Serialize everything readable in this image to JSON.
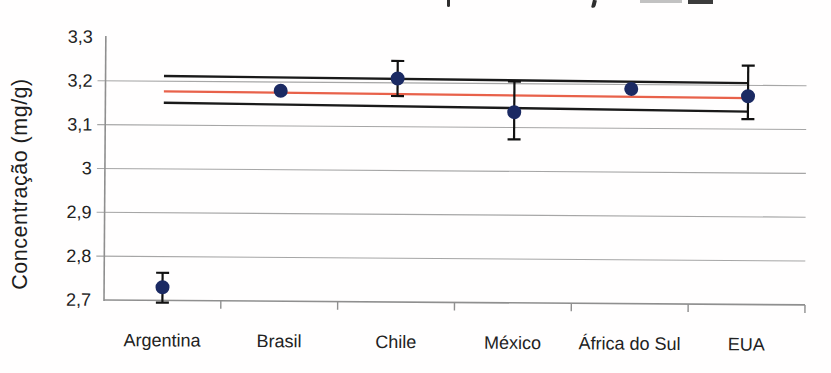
{
  "figure": {
    "background": "#fffefe",
    "cropped_top_fragments": [
      {
        "x": 447,
        "y": 0,
        "w": 3,
        "h": 7,
        "color": "#2e2e2e",
        "radius": "0 0 2px 2px",
        "rotate": 0
      },
      {
        "x": 592,
        "y": 0,
        "w": 4,
        "h": 8,
        "color": "#2e2e2e",
        "radius": "0 0 3px 1px",
        "rotate": 14
      },
      {
        "x": 640,
        "y": 0,
        "w": 42,
        "h": 3,
        "color": "#c2c2c2",
        "radius": "0",
        "rotate": 0
      },
      {
        "x": 688,
        "y": 0,
        "w": 25,
        "h": 4,
        "color": "#3c3c3c",
        "radius": "0",
        "rotate": 0
      }
    ]
  },
  "chart_data": {
    "type": "scatter",
    "title": "",
    "xlabel": "",
    "ylabel": "Concentração (mg/g)",
    "categories": [
      "Argentina",
      "Brasil",
      "Chile",
      "México",
      "África do Sul",
      "EUA"
    ],
    "points": [
      {
        "label": "Argentina",
        "value": 2.73,
        "err_up": 0.033,
        "err_down": 0.035
      },
      {
        "label": "Brasil",
        "value": 3.18,
        "err_up": 0,
        "err_down": 0
      },
      {
        "label": "Chile",
        "value": 3.21,
        "err_up": 0.04,
        "err_down": 0.04
      },
      {
        "label": "México",
        "value": 3.135,
        "err_up": 0.07,
        "err_down": 0.062
      },
      {
        "label": "África do Sul",
        "value": 3.19,
        "err_up": 0,
        "err_down": 0
      },
      {
        "label": "EUA",
        "value": 3.175,
        "err_up": 0.07,
        "err_down": 0.052
      }
    ],
    "reference_lines": [
      {
        "name": "upper-limit-line",
        "color": "#1a1a1a",
        "start_value": 3.212,
        "end_value": 3.205,
        "width": 2.4
      },
      {
        "name": "mean-line",
        "color": "#e8614a",
        "start_value": 3.177,
        "end_value": 3.171,
        "width": 2.2
      },
      {
        "name": "lower-limit-line",
        "color": "#1a1a1a",
        "start_value": 3.151,
        "end_value": 3.14,
        "width": 2.4
      }
    ],
    "y_axis": {
      "min": 2.7,
      "max": 3.3,
      "ticks": [
        {
          "label": "3,3",
          "value": 3.3
        },
        {
          "label": "3,2",
          "value": 3.2
        },
        {
          "label": "3,1",
          "value": 3.1
        },
        {
          "label": "3",
          "value": 3.0
        },
        {
          "label": "2,9",
          "value": 2.9
        },
        {
          "label": "2,8",
          "value": 2.8
        },
        {
          "label": "2,7",
          "value": 2.7
        }
      ],
      "gridline_values": [
        3.2,
        3.1,
        3.0,
        2.9,
        2.8
      ]
    },
    "legend": "none",
    "grid": "horizontal",
    "marker_color": "#1b2a63",
    "error_bar_color": "#111111",
    "grid_color": "#a6a6a6",
    "axis_color": "#8f8f8f",
    "text_color": "#222222"
  }
}
